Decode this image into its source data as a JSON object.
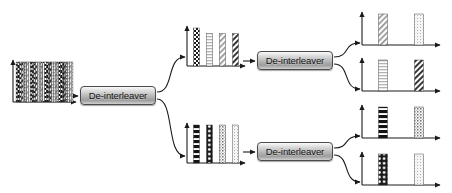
{
  "diagram": {
    "background": "#ffffff",
    "line_color": "#1a1a1a",
    "box_label": "De-interleaver",
    "stages": 3
  },
  "boxes": [
    {
      "id": "box-stage1",
      "label": "De-interleaver",
      "x": 80,
      "y": 86,
      "w": 76,
      "h": 19
    },
    {
      "id": "box-stage2-top",
      "label": "De-interleaver",
      "x": 257,
      "y": 51,
      "w": 76,
      "h": 19
    },
    {
      "id": "box-stage2-bottom",
      "label": "De-interleaver",
      "x": 257,
      "y": 142,
      "w": 76,
      "h": 19
    }
  ],
  "chart_data": [
    {
      "id": "plot-input",
      "type": "bar",
      "title": "Interleaved input stream",
      "xlabel": "",
      "ylabel": "",
      "axis": {
        "x": 13,
        "y": 56,
        "w": 67,
        "h": 46
      },
      "grid": false,
      "legend": false,
      "categories": [
        "b1",
        "b2",
        "b3",
        "b4",
        "b5",
        "b6",
        "b7",
        "b8",
        "b9",
        "b10",
        "b11",
        "b12",
        "b13",
        "b14",
        "b15",
        "b16",
        "b17",
        "b18",
        "b19",
        "b20",
        "b21",
        "b22",
        "b23",
        "b24",
        "b25",
        "b26",
        "b27",
        "b28",
        "b29",
        "b30",
        "b31",
        "b32"
      ],
      "values": [
        38,
        38,
        38,
        38,
        38,
        38,
        38,
        38,
        38,
        38,
        38,
        38,
        38,
        38,
        38,
        38,
        38,
        38,
        38,
        38,
        38,
        38,
        38,
        38,
        38,
        38,
        38,
        38,
        38,
        38,
        38,
        38
      ],
      "patterns": [
        "checker",
        "hstripe-dark",
        "circles",
        "diag-dark",
        "dots-gray",
        "hstripe-light",
        "diag-light",
        "dots-light",
        "checker",
        "hstripe-dark",
        "circles",
        "diag-dark",
        "dots-gray",
        "hstripe-light",
        "diag-light",
        "dots-light",
        "checker",
        "hstripe-dark",
        "circles",
        "diag-dark",
        "dots-gray",
        "hstripe-light",
        "diag-light",
        "dots-light",
        "checker",
        "hstripe-dark",
        "circles",
        "diag-dark",
        "dots-gray",
        "hstripe-light",
        "diag-light",
        "dots-light"
      ]
    },
    {
      "id": "plot-stage2-top",
      "type": "bar",
      "title": "Stage 1 output - upper branch",
      "xlabel": "",
      "ylabel": "",
      "axis": {
        "x": 187,
        "y": 22,
        "w": 62,
        "h": 44
      },
      "grid": false,
      "legend": false,
      "categories": [
        "s1",
        "s2",
        "s3",
        "s4"
      ],
      "values": [
        40,
        34,
        34,
        34
      ],
      "patterns": [
        "checker",
        "hstripe-light",
        "diag-light",
        "diag-dark"
      ]
    },
    {
      "id": "plot-stage2-bottom",
      "type": "bar",
      "title": "Stage 1 output - lower branch",
      "xlabel": "",
      "ylabel": "",
      "axis": {
        "x": 187,
        "y": 119,
        "w": 62,
        "h": 44
      },
      "grid": false,
      "legend": false,
      "categories": [
        "s1",
        "s2",
        "s3",
        "s4"
      ],
      "values": [
        34,
        34,
        34,
        34
      ],
      "patterns": [
        "hstripe-dark",
        "circles",
        "dots-gray",
        "dots-light"
      ]
    },
    {
      "id": "plot-out-1",
      "type": "bar",
      "title": "Output 1",
      "xlabel": "",
      "ylabel": "",
      "axis": {
        "x": 362,
        "y": 8,
        "w": 82,
        "h": 37
      },
      "grid": false,
      "legend": false,
      "categories": [
        "o1",
        "o2"
      ],
      "values": [
        30,
        30
      ],
      "patterns": [
        "diag-light",
        "dots-light"
      ]
    },
    {
      "id": "plot-out-2",
      "type": "bar",
      "title": "Output 2",
      "xlabel": "",
      "ylabel": "",
      "axis": {
        "x": 362,
        "y": 54,
        "w": 82,
        "h": 37
      },
      "grid": false,
      "legend": false,
      "categories": [
        "o1",
        "o2"
      ],
      "values": [
        30,
        30
      ],
      "patterns": [
        "hstripe-light",
        "diag-dark"
      ]
    },
    {
      "id": "plot-out-3",
      "type": "bar",
      "title": "Output 3",
      "xlabel": "",
      "ylabel": "",
      "axis": {
        "x": 362,
        "y": 101,
        "w": 82,
        "h": 37
      },
      "grid": false,
      "legend": false,
      "categories": [
        "o1",
        "o2"
      ],
      "values": [
        30,
        30
      ],
      "patterns": [
        "hstripe-dark",
        "dots-gray"
      ]
    },
    {
      "id": "plot-out-4",
      "type": "bar",
      "title": "Output 4",
      "xlabel": "",
      "ylabel": "",
      "axis": {
        "x": 362,
        "y": 148,
        "w": 82,
        "h": 37
      },
      "grid": false,
      "legend": false,
      "categories": [
        "o1",
        "o2"
      ],
      "values": [
        30,
        30
      ],
      "patterns": [
        "circles",
        "dots-light"
      ]
    }
  ],
  "connectors": [
    {
      "id": "conn-input-to-box1",
      "kind": "straight",
      "from": [
        66,
        96
      ],
      "to": [
        79,
        96
      ]
    },
    {
      "id": "conn-box1-to-upper",
      "kind": "curve",
      "from": [
        157,
        92
      ],
      "to": [
        186,
        57
      ]
    },
    {
      "id": "conn-box1-to-lower",
      "kind": "curve",
      "from": [
        157,
        99
      ],
      "to": [
        186,
        156
      ]
    },
    {
      "id": "conn-upper-to-box2",
      "kind": "straight",
      "from": [
        243,
        61
      ],
      "to": [
        256,
        61
      ]
    },
    {
      "id": "conn-lower-to-box3",
      "kind": "straight",
      "from": [
        243,
        152
      ],
      "to": [
        256,
        152
      ]
    },
    {
      "id": "conn-box2-to-out1",
      "kind": "curve",
      "from": [
        334,
        57
      ],
      "to": [
        361,
        43
      ]
    },
    {
      "id": "conn-box2-to-out2",
      "kind": "curve",
      "from": [
        334,
        64
      ],
      "to": [
        361,
        89
      ]
    },
    {
      "id": "conn-box3-to-out3",
      "kind": "curve",
      "from": [
        334,
        148
      ],
      "to": [
        361,
        136
      ]
    },
    {
      "id": "conn-box3-to-out4",
      "kind": "curve",
      "from": [
        334,
        155
      ],
      "to": [
        361,
        182
      ]
    }
  ]
}
